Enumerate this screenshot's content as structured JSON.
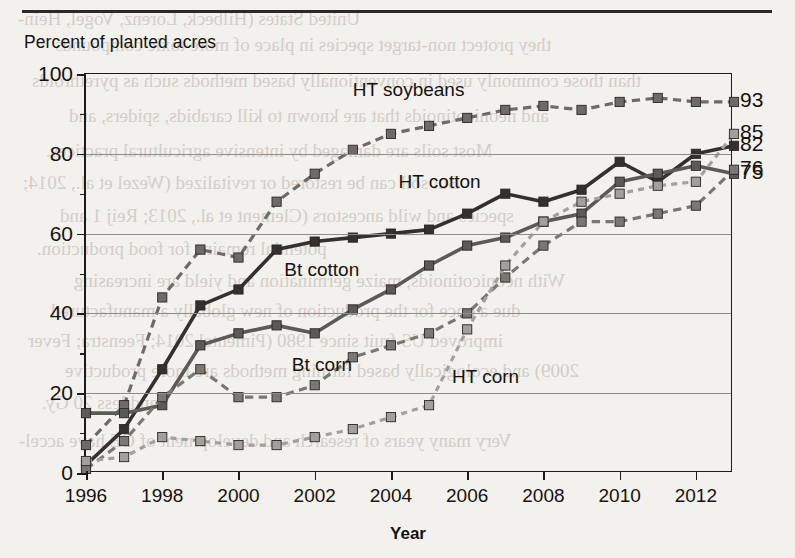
{
  "page": {
    "y_axis_caption": "Percent of planted acres",
    "x_axis_title": "Year",
    "bleed_text": [
      "United States (Hilbeck, Lorenz, Vogel, Hein-",
      "they protect non-target species in place of more toxic compounds",
      "than those commonly used in conventionally based methods such as pyrethroids",
      "and neonicotinoids that are known to kill carabids, spiders, and",
      "Most soils are damaged by intensive agricultural practices.",
      "But soil can be restored or revitalized (Wezel et al., 2014;",
      "species and wild ancestors (Clement et al., 2013; Reij 1 and",
      "potential remains for food production.",
      "With neonicotinoids, maize germination and yield are increasing",
      "due a once for the production of new globally a manufactured",
      "improved US fruit since 1980 (Pimentel 2014; Feenstra; Fever",
      "2009) and ecologically based farming methods are more productive",
      "and less 20 Gy.",
      "Very many years of research and development of GE have accel-"
    ]
  },
  "chart_data": {
    "type": "line",
    "title": "",
    "xlabel": "Year",
    "ylabel": "Percent of planted acres",
    "xlim": [
      1996,
      2013
    ],
    "ylim": [
      0,
      100
    ],
    "yticks": [
      0,
      20,
      40,
      60,
      80,
      100
    ],
    "yticklabels": [
      "0",
      "20",
      "40",
      "60",
      "80",
      "100"
    ],
    "yminor": [
      10,
      30,
      50,
      70,
      90
    ],
    "xticks": [
      1996,
      1998,
      2000,
      2002,
      2004,
      2006,
      2008,
      2010,
      2012
    ],
    "xticklabels": [
      "1996",
      "1998",
      "2000",
      "2002",
      "2004",
      "2006",
      "2008",
      "2010",
      "2012"
    ],
    "grid": "horizontal-major",
    "legend_position": "inline-annotations",
    "x": [
      1996,
      1997,
      1998,
      1999,
      2000,
      2001,
      2002,
      2003,
      2004,
      2005,
      2006,
      2007,
      2008,
      2009,
      2010,
      2011,
      2012,
      2013
    ],
    "series": [
      {
        "name": "HT soybeans",
        "color": "#6e6a66",
        "dash": "dashed",
        "end_value": 93,
        "label_x_year": 2003.0,
        "label_y_value": 96,
        "values": [
          7,
          17,
          44,
          56,
          54,
          68,
          75,
          81,
          85,
          87,
          89,
          91,
          92,
          91,
          93,
          94,
          93,
          93
        ]
      },
      {
        "name": "HT cotton",
        "color": "#33302d",
        "dash": "solid",
        "end_value": 82,
        "label_x_year": 2004.2,
        "label_y_value": 73,
        "values": [
          2,
          11,
          26,
          42,
          46,
          56,
          58,
          59,
          60,
          61,
          65,
          70,
          68,
          71,
          78,
          73,
          80,
          82
        ]
      },
      {
        "name": "Bt cotton",
        "color": "#5d5955",
        "dash": "solid",
        "end_value": 75,
        "label_x_year": 2001.2,
        "label_y_value": 51,
        "values": [
          15,
          15,
          17,
          32,
          35,
          37,
          35,
          41,
          46,
          52,
          57,
          59,
          63,
          65,
          73,
          75,
          77,
          75
        ]
      },
      {
        "name": "Bt corn",
        "color": "#7b7773",
        "dash": "dashed",
        "end_value": 76,
        "label_x_year": 2001.4,
        "label_y_value": 27,
        "values": [
          1,
          8,
          19,
          26,
          19,
          19,
          22,
          29,
          32,
          35,
          40,
          49,
          57,
          63,
          63,
          65,
          67,
          76
        ]
      },
      {
        "name": "HT corn",
        "color": "#a3a09c",
        "dash": "dotted",
        "end_value": 85,
        "label_x_year": 2005.6,
        "label_y_value": 24,
        "values": [
          3,
          4,
          9,
          8,
          7,
          7,
          9,
          11,
          14,
          17,
          36,
          52,
          63,
          68,
          70,
          72,
          73,
          85
        ]
      }
    ],
    "end_labels": [
      {
        "value": 93,
        "text": "93",
        "series": "HT soybeans"
      },
      {
        "value": 85,
        "text": "85",
        "series": "HT corn"
      },
      {
        "value": 82,
        "text": "82",
        "series": "HT cotton"
      },
      {
        "value": 76,
        "text": "76",
        "series": "Bt corn"
      },
      {
        "value": 75,
        "text": "75",
        "series": "Bt cotton"
      }
    ]
  }
}
